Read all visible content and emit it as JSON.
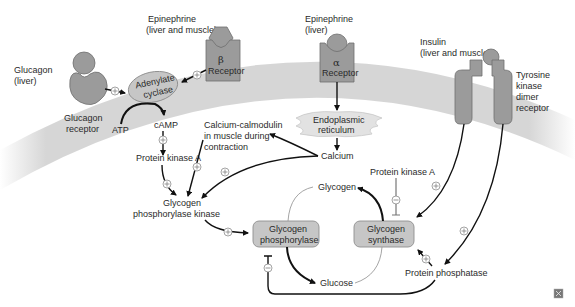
{
  "diagram": {
    "colors": {
      "membrane": "#d4d4d4",
      "receptor": "#9b9b9b",
      "enzyme_box": "#c6c6c6",
      "arrow": "#111111",
      "sign_circle": "#8d8d8d"
    },
    "hormones": {
      "glucagon": {
        "name": "Glucagon",
        "site": "(liver)"
      },
      "epi_beta": {
        "name": "Epinephrine",
        "site": "(liver and muscle)"
      },
      "epi_alpha": {
        "name": "Epinephrine",
        "site": "(liver)"
      },
      "insulin": {
        "name": "Insulin",
        "site": "(liver and muscle)"
      }
    },
    "receptors": {
      "glucagon": {
        "line1": "Glucagon",
        "line2": "receptor"
      },
      "beta": {
        "symbol": "β",
        "label": "Receptor"
      },
      "alpha": {
        "symbol": "α",
        "label": "Receptor"
      },
      "tyrosine": {
        "line1": "Tyrosine",
        "line2": "kinase",
        "line3": "dimer",
        "line4": "receptor"
      }
    },
    "nodes": {
      "adenylate_cyclase": {
        "line1": "Adenylate",
        "line2": "cyclase"
      },
      "atp": "ATP",
      "camp": "cAMP",
      "pka1": "Protein kinase A",
      "calmodulin": {
        "line1": "Calcium-calmodulin",
        "line2": "in muscle during",
        "line3": "contraction"
      },
      "er": {
        "line1": "Endoplasmic",
        "line2": "reticulum"
      },
      "calcium": "Calcium",
      "gpk": {
        "line1": "Glycogen",
        "line2": "phosphorylase kinase"
      },
      "pka2": "Protein kinase A",
      "glycogen": "Glycogen",
      "glucose": "Glucose",
      "gp": {
        "line1": "Glycogen",
        "line2": "phosphorylase"
      },
      "gs": {
        "line1": "Glycogen",
        "line2": "synthase"
      },
      "pp": "Protein phosphatase"
    },
    "signs": {
      "plus": "+",
      "minus": "−"
    },
    "corner_icon": "expand-icon"
  }
}
